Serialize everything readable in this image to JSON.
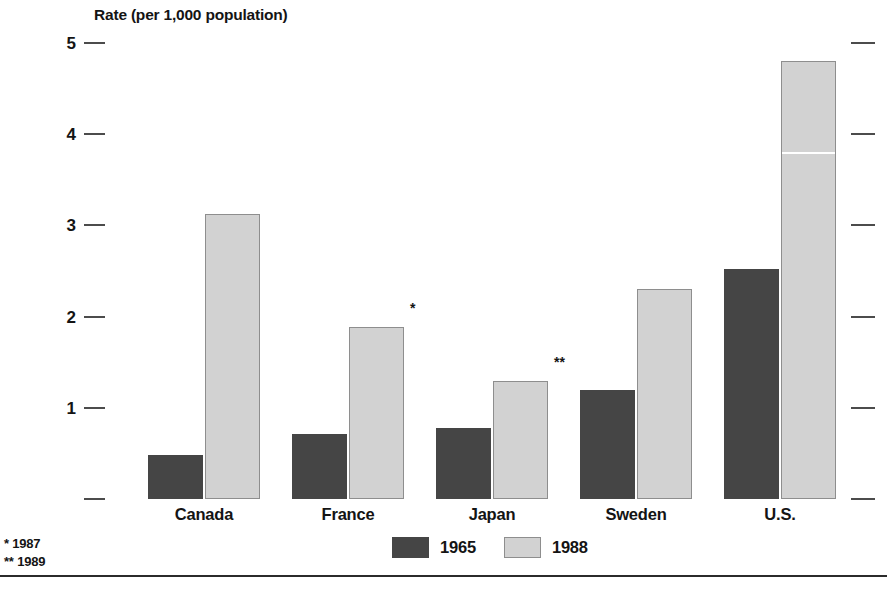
{
  "chart_data": {
    "type": "bar",
    "title": "",
    "ylabel": "Rate (per 1,000 population)",
    "xlabel": "",
    "ylim": [
      0,
      5
    ],
    "yticks": [
      {
        "value": 5,
        "label": "5"
      },
      {
        "value": 4,
        "label": "4"
      },
      {
        "value": 3,
        "label": "3"
      },
      {
        "value": 2,
        "label": "2"
      },
      {
        "value": 1,
        "label": "1"
      },
      {
        "value": 0,
        "label": ""
      }
    ],
    "grid": false,
    "legend_position": "bottom-center",
    "categories": [
      "Canada",
      "France",
      "Japan",
      "Sweden",
      "U.S."
    ],
    "series": [
      {
        "name": "1965",
        "color": "#454545",
        "values": [
          0.48,
          0.71,
          0.78,
          1.19,
          2.52
        ]
      },
      {
        "name": "1988",
        "color": "#d2d2d2",
        "values": [
          3.12,
          1.89,
          1.29,
          2.3,
          4.8
        ]
      }
    ],
    "annotations": [
      {
        "category": "France",
        "series": "1988",
        "marker": "*"
      },
      {
        "category": "Japan",
        "series": "1988",
        "marker": "**"
      }
    ],
    "footnotes": [
      "* 1987",
      "** 1989"
    ]
  },
  "legend": {
    "items": [
      {
        "label": "1965",
        "swatch": "dark"
      },
      {
        "label": "1988",
        "swatch": "light"
      }
    ]
  },
  "colors": {
    "series_1965": "#454545",
    "series_1988": "#d2d2d2",
    "axis": "#4c4c4c",
    "text": "#141414",
    "background": "#ffffff"
  }
}
